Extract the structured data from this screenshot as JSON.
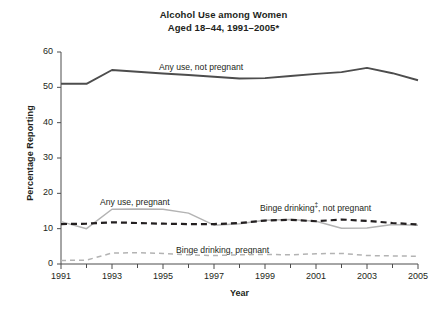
{
  "chart_data": {
    "type": "line",
    "title": "Alcohol Use among Women",
    "subtitle": "Aged 18–44, 1991–2005*",
    "xlabel": "Year",
    "ylabel": "Percentage Reporting",
    "xlim": [
      1991,
      2005
    ],
    "ylim": [
      0,
      60
    ],
    "yticks": [
      0,
      10,
      20,
      30,
      40,
      50,
      60
    ],
    "ytick_labels": [
      "0",
      "10",
      "20",
      "30",
      "40",
      "50",
      "60"
    ],
    "xticks": [
      1991,
      1992,
      1993,
      1994,
      1995,
      1996,
      1997,
      1998,
      1999,
      2000,
      2001,
      2002,
      2003,
      2004,
      2005
    ],
    "xtick_labels": [
      "1991",
      "",
      "1993",
      "",
      "1995",
      "",
      "1997",
      "",
      "1999",
      "",
      "2001",
      "",
      "2003",
      "",
      "2005"
    ],
    "x": [
      1991,
      1992,
      1993,
      1994,
      1995,
      1996,
      1997,
      1998,
      1999,
      2000,
      2001,
      2002,
      2003,
      2004,
      2005
    ],
    "grid": false,
    "legend_position": "inline-annotations",
    "series": [
      {
        "name": "Any use, not pregnant",
        "style": "solid",
        "color": "#4d4d4d",
        "width": 1.9,
        "values": [
          51.0,
          51.0,
          54.9,
          54.4,
          53.9,
          53.5,
          53.0,
          52.5,
          52.6,
          53.2,
          53.8,
          54.3,
          55.5,
          54.0,
          52.0
        ]
      },
      {
        "name": "Any use, pregnant",
        "style": "solid",
        "color": "#b3b3b3",
        "width": 1.5,
        "values": [
          12.0,
          10.0,
          15.5,
          15.6,
          15.5,
          14.4,
          11.0,
          11.4,
          12.4,
          12.6,
          12.1,
          10.1,
          10.2,
          11.2,
          11.0
        ]
      },
      {
        "name": "Binge drinking‡, not pregnant",
        "style": "dashed",
        "color": "#231f20",
        "width": 2.2,
        "values": [
          11.3,
          11.4,
          11.8,
          11.6,
          11.4,
          11.3,
          11.3,
          11.6,
          12.3,
          12.5,
          12.1,
          12.6,
          12.2,
          11.6,
          11.2
        ]
      },
      {
        "name": "Binge drinking, pregnant",
        "style": "dashed",
        "color": "#b3b3b3",
        "width": 1.5,
        "values": [
          1.0,
          1.1,
          3.1,
          3.2,
          3.0,
          2.6,
          2.4,
          2.6,
          2.7,
          2.6,
          2.9,
          3.0,
          2.4,
          2.3,
          2.2
        ]
      }
    ],
    "annotations": [
      {
        "text": "Any use, not pregnant",
        "x_px": 159,
        "y_px": 62,
        "series": "Any use, not pregnant"
      },
      {
        "text": "Any use, pregnant",
        "x_px": 100,
        "y_px": 197,
        "series": "Any use, pregnant"
      },
      {
        "text": "Binge drinking‡, not pregnant",
        "x_px": 260,
        "y_px": 203,
        "series": "Binge drinking‡, not pregnant"
      },
      {
        "text": "Binge drinking, pregnant",
        "x_px": 176,
        "y_px": 245,
        "series": "Binge drinking, pregnant"
      }
    ],
    "plot_area_px": {
      "left": 61,
      "right": 418,
      "top": 52,
      "bottom": 264
    }
  }
}
